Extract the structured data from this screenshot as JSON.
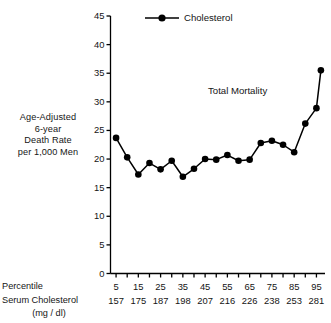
{
  "chart_data": {
    "type": "line",
    "title": "",
    "annotation": "Total Mortality",
    "ylabel_lines": [
      "Age-Adjusted",
      "6-year",
      "Death Rate",
      "per 1,000 Men"
    ],
    "ylabel": "Age-Adjusted 6-year Death Rate per 1,000 Men",
    "xlabel": "",
    "legend": [
      {
        "name": "Cholesterol",
        "marker": "filled-circle",
        "color": "#000000"
      }
    ],
    "legend_position": "top-center",
    "grid": false,
    "ylim": [
      0,
      45
    ],
    "ytick_step": 5,
    "yticks": [
      0,
      5,
      10,
      15,
      20,
      25,
      30,
      35,
      40,
      45
    ],
    "ytick_labels": [
      "0",
      "5",
      "10",
      "15",
      "20",
      "25",
      "30",
      "35",
      "40",
      "45"
    ],
    "xlim": [
      2.5,
      97.5
    ],
    "xticks": [
      5,
      10,
      15,
      20,
      25,
      30,
      35,
      40,
      45,
      50,
      55,
      60,
      65,
      70,
      75,
      80,
      85,
      90,
      95
    ],
    "xtick_labels_shown": [
      "5",
      "15",
      "25",
      "35",
      "45",
      "55",
      "65",
      "75",
      "85",
      "95"
    ],
    "xtick_labels_shown_values": [
      5,
      15,
      25,
      35,
      45,
      55,
      65,
      75,
      85,
      95
    ],
    "axis_row_labels": {
      "percentile": "Percentile",
      "serum": "Serum Cholesterol",
      "units": "(mg / dl)"
    },
    "serum_cholesterol_row": [
      "157",
      "175",
      "187",
      "198",
      "207",
      "216",
      "226",
      "238",
      "253",
      "281"
    ],
    "x": [
      5,
      10,
      15,
      20,
      25,
      30,
      35,
      40,
      45,
      50,
      55,
      60,
      65,
      70,
      75,
      80,
      85,
      90,
      95,
      97
    ],
    "series": [
      {
        "name": "Cholesterol",
        "values": [
          23.7,
          20.3,
          17.3,
          19.3,
          18.2,
          19.7,
          16.9,
          18.3,
          20.0,
          19.9,
          20.7,
          19.7,
          19.9,
          22.8,
          23.2,
          22.5,
          21.2,
          26.2,
          28.9,
          35.5
        ]
      }
    ],
    "point_count": 20,
    "marker_size_px": 4.6,
    "line_width_px": 1.5,
    "series_color": "#000000"
  },
  "axis": {
    "y_title_lines": [
      "Age-Adjusted",
      "6-year",
      "Death Rate",
      "per 1,000 Men"
    ]
  }
}
